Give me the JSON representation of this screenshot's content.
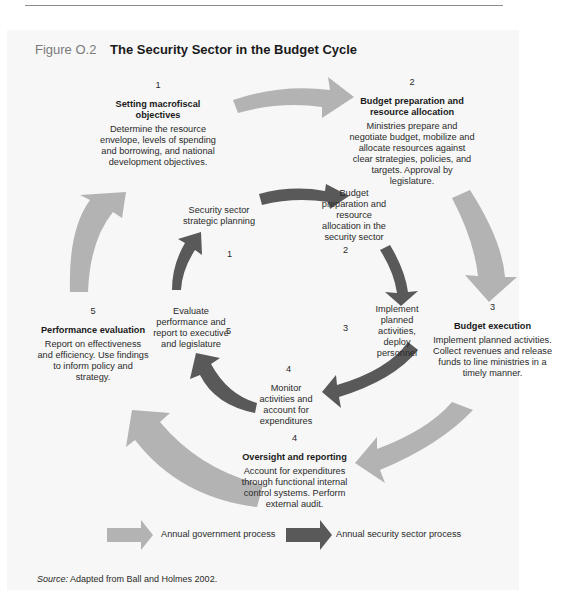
{
  "figure": {
    "number": "Figure O.2",
    "title": "The Security Sector in the Budget Cycle",
    "colors": {
      "outer_arrow": "#b3b3b3",
      "inner_arrow": "#595959",
      "panel_background": "#f7f7f7"
    }
  },
  "outer_cycle": [
    {
      "step": "1",
      "heading": "Setting macrofiscal objectives",
      "body": "Determine the resource envelope, levels of spending and borrowing, and national development objectives."
    },
    {
      "step": "2",
      "heading": "Budget preparation and resource allocation",
      "body": "Ministries prepare and negotiate budget, mobilize and allocate resources against clear strategies, policies, and targets. Approval by legislature."
    },
    {
      "step": "3",
      "heading": "Budget execution",
      "body": "Implement planned activities. Collect revenues and release funds to line ministries in a timely manner."
    },
    {
      "step": "4",
      "heading": "Oversight and reporting",
      "body": "Account for expenditures through functional internal control systems. Perform external audit."
    },
    {
      "step": "5",
      "heading": "Performance evaluation",
      "body": "Report on effectiveness and efficiency. Use findings to inform policy and strategy."
    }
  ],
  "inner_cycle": [
    {
      "step": "1",
      "label": "Security sector strategic planning"
    },
    {
      "step": "2",
      "label": "Budget preparation and resource allocation in the security sector"
    },
    {
      "step": "3",
      "label": "Implement planned activities, deploy personnel"
    },
    {
      "step": "4",
      "label": "Monitor activities and account for expenditures"
    },
    {
      "step": "5",
      "label": "Evaluate performance and report to executive and legislature"
    }
  ],
  "legend": {
    "government": "Annual government process",
    "security": "Annual security sector process"
  },
  "source": {
    "prefix": "Source:",
    "text": "Adapted from Ball and Holmes 2002."
  }
}
